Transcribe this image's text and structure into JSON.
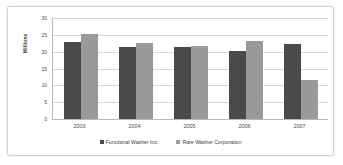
{
  "chart_data": {
    "type": "bar",
    "title": "",
    "subtitle": "",
    "xlabel": "",
    "ylabel": "Millions",
    "categories": [
      "2003",
      "2004",
      "2005",
      "2006",
      "2007"
    ],
    "series": [
      {
        "name": "Functional Washer Inc.",
        "color": "#4a4a4a",
        "values": [
          22.8,
          21.5,
          21.3,
          20.1,
          22.2
        ]
      },
      {
        "name": "Rare Washer Corporation",
        "color": "#9a9a9a",
        "values": [
          25.4,
          22.7,
          21.6,
          23.3,
          11.5
        ]
      }
    ],
    "ylim": [
      0,
      30
    ],
    "ytick_labels": [
      "30",
      "25",
      "20",
      "15",
      "10",
      "5",
      "0"
    ],
    "ytick_values": [
      30,
      25,
      20,
      15,
      10,
      5,
      0
    ],
    "grid": true,
    "legend_position": "bottom"
  },
  "colors": {
    "series_0": "#4a4a4a",
    "series_1": "#9a9a9a",
    "gridline": "#d8d8d8",
    "axis": "#b9b9b9",
    "frame_border": "#d2d2d2",
    "background": "#ffffff"
  }
}
